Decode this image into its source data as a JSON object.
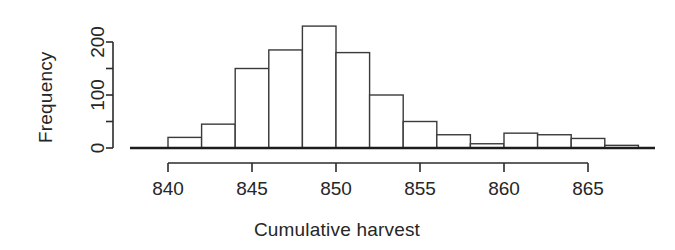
{
  "chart_data": {
    "type": "bar",
    "subtype": "histogram",
    "title": "",
    "xlabel": "Cumulative harvest",
    "ylabel": "Frequency",
    "bin_width": 2,
    "bin_starts": [
      838,
      840,
      842,
      844,
      846,
      848,
      850,
      852,
      854,
      856,
      858,
      860,
      862,
      864,
      866
    ],
    "bin_ends": [
      840,
      842,
      844,
      846,
      848,
      850,
      852,
      854,
      856,
      858,
      860,
      862,
      864,
      866,
      868
    ],
    "categories": [
      "838-840",
      "840-842",
      "842-844",
      "844-846",
      "846-848",
      "848-850",
      "850-852",
      "852-854",
      "854-856",
      "856-858",
      "858-860",
      "860-862",
      "862-864",
      "864-866",
      "866-868"
    ],
    "values": [
      0,
      20,
      45,
      150,
      185,
      230,
      180,
      100,
      50,
      25,
      8,
      28,
      25,
      18,
      5
    ],
    "xlim": [
      838,
      868
    ],
    "ylim": [
      0,
      230
    ],
    "x_ticks": [
      840,
      845,
      850,
      855,
      860,
      865
    ],
    "x_tick_labels": [
      "840",
      "845",
      "850",
      "855",
      "860",
      "865"
    ],
    "y_ticks": [
      0,
      50,
      100,
      150,
      200
    ],
    "y_tick_labels": [
      "0",
      "",
      "100",
      "",
      "200"
    ],
    "y_labeled_ticks": [
      0,
      100,
      200
    ],
    "grid": false,
    "legend": false,
    "bar_fill": "#ffffff",
    "bar_stroke": "#3a3a3a",
    "axis_color": "#2b2b2b",
    "background": "#ffffff"
  },
  "axes": {
    "x_axis_label": "Cumulative harvest",
    "y_axis_label": "Frequency"
  }
}
